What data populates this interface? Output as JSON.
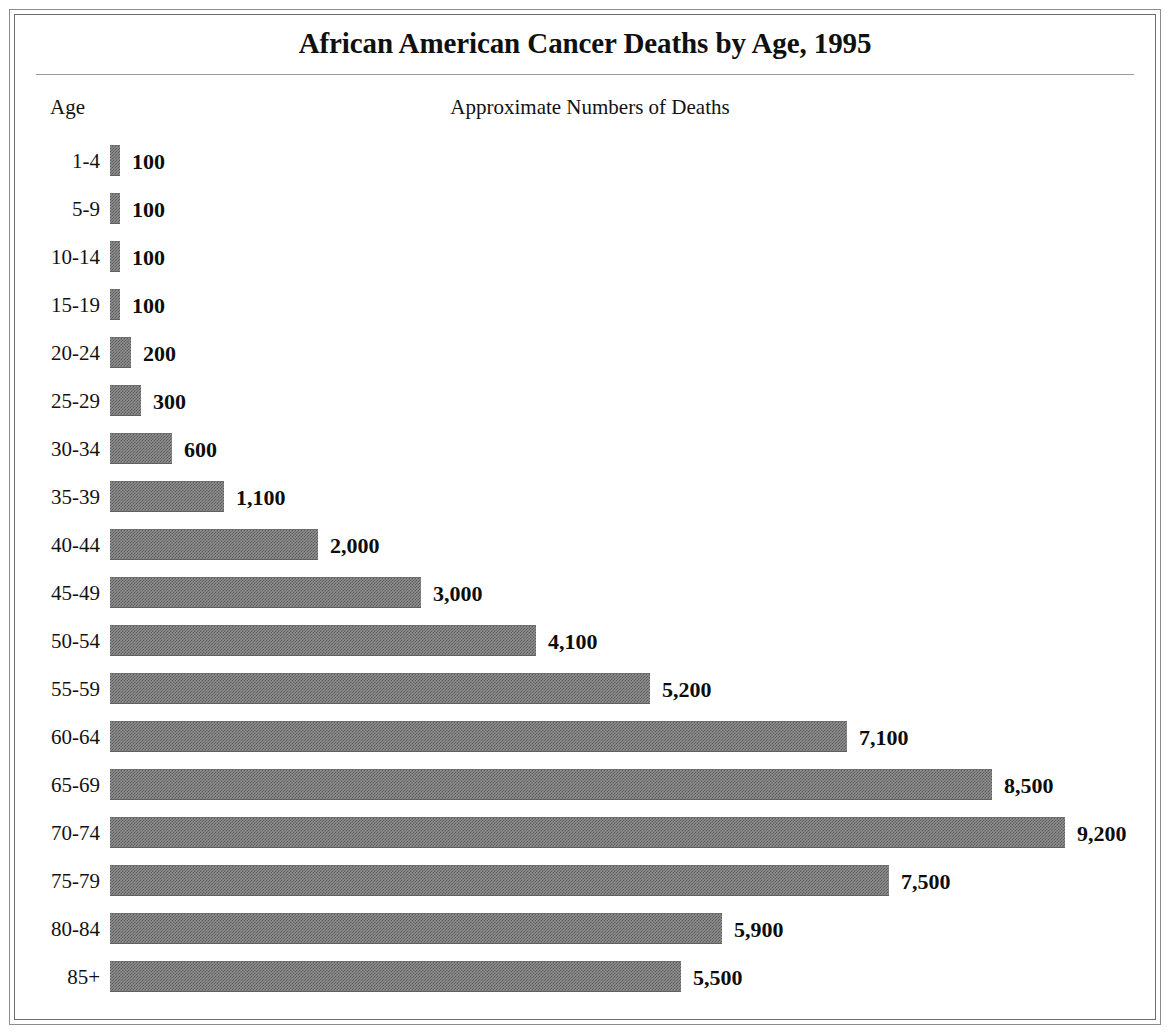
{
  "figure": {
    "title": "African American Cancer Deaths by Age, 1995",
    "age_column_header": "Age",
    "values_column_header": "Approximate Numbers of Deaths",
    "bar_color": "#8e8e8e",
    "frame_color": "#6b6b6b",
    "background_color": "#ffffff"
  },
  "chart_data": {
    "type": "bar",
    "orientation": "horizontal",
    "title": "African American Cancer Deaths by Age, 1995",
    "subtitle": "",
    "xlabel": "Approximate Numbers of Deaths",
    "ylabel": "Age",
    "grid": false,
    "legend": null,
    "xlim": [
      0,
      9200
    ],
    "categories": [
      "1-4",
      "5-9",
      "10-14",
      "15-19",
      "20-24",
      "25-29",
      "30-34",
      "35-39",
      "40-44",
      "45-49",
      "50-54",
      "55-59",
      "60-64",
      "65-69",
      "70-74",
      "75-79",
      "80-84",
      "85+"
    ],
    "values": [
      100,
      100,
      100,
      100,
      200,
      300,
      600,
      1100,
      2000,
      3000,
      4100,
      5200,
      7100,
      8500,
      9200,
      7500,
      5900,
      5500
    ],
    "value_labels": [
      "100",
      "100",
      "100",
      "100",
      "200",
      "300",
      "600",
      "1,100",
      "2,000",
      "3,000",
      "4,100",
      "5,200",
      "7,100",
      "8,500",
      "9,200",
      "7,500",
      "5,900",
      "5,500"
    ]
  }
}
